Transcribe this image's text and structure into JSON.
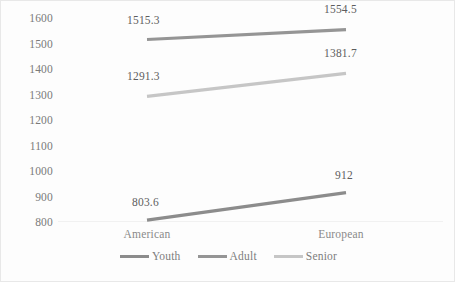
{
  "chart_data": {
    "type": "line",
    "title": "",
    "subtitle": "",
    "xlabel": "",
    "ylabel": "",
    "categories": [
      "American",
      "European"
    ],
    "x": [
      "American",
      "European"
    ],
    "series": [
      {
        "name": "Youth",
        "values": [
          803.6,
          912
        ],
        "labels": [
          "803.6",
          "912"
        ],
        "color": "#8c8c8c"
      },
      {
        "name": "Adult",
        "values": [
          1515.3,
          1554.5
        ],
        "labels": [
          "1515.3",
          "1554.5"
        ],
        "color": "#959595"
      },
      {
        "name": "Senior",
        "values": [
          1291.3,
          1381.7
        ],
        "labels": [
          "1291.3",
          "1381.7"
        ],
        "color": "#c6c6c6"
      }
    ],
    "ylim": [
      800,
      1600
    ],
    "ytick_step": 100,
    "ytick_labels": [
      "1600",
      "1500",
      "1400",
      "1300",
      "1200",
      "1100",
      "1000",
      "900",
      "800"
    ],
    "grid": "baseline-only",
    "legend_position": "bottom-center",
    "legend_entries": [
      "Youth",
      "Adult",
      "Senior"
    ],
    "data_labels_shown": true,
    "markers": false
  },
  "axis": {
    "y_ticks": [
      {
        "value": "1600"
      },
      {
        "value": "1500"
      },
      {
        "value": "1400"
      },
      {
        "value": "1300"
      },
      {
        "value": "1200"
      },
      {
        "value": "1100"
      },
      {
        "value": "1000"
      },
      {
        "value": "900"
      },
      {
        "value": "800"
      }
    ],
    "x_ticks": [
      {
        "value": "American"
      },
      {
        "value": "European"
      }
    ]
  },
  "labels": {
    "adult_left": "1515.3",
    "adult_right": "1554.5",
    "senior_left": "1291.3",
    "senior_right": "1381.7",
    "youth_left": "803.6",
    "youth_right": "912"
  },
  "legend": {
    "items": [
      {
        "label": "Youth",
        "color": "#8c8c8c"
      },
      {
        "label": "Adult",
        "color": "#959595"
      },
      {
        "label": "Senior",
        "color": "#c6c6c6"
      }
    ]
  },
  "colors": {
    "youth": "#8c8c8c",
    "adult": "#959595",
    "senior": "#c6c6c6",
    "axis_text": "#7a7a7a",
    "category_text": "#8a8a8a",
    "data_label_text": "#5d5d5d",
    "gridline": "#f1f1f1",
    "chart_border": "#e8e8e8",
    "background": "#fdfdfd"
  }
}
